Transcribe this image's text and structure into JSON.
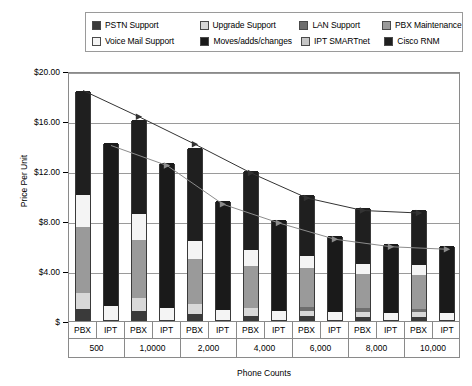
{
  "chart_data": {
    "type": "bar",
    "title": "",
    "xlabel": "Phone Counts",
    "ylabel": "Price Per Unit",
    "ylim": [
      0,
      20
    ],
    "yticks": [
      "$",
      "$4.00",
      "$8.00",
      "$12.00",
      "$16.00",
      "$20.00"
    ],
    "ytick_values": [
      0,
      4,
      8,
      12,
      16,
      20
    ],
    "grid": true,
    "stacked": true,
    "legend_position": "top",
    "groups": [
      "500",
      "1,0000",
      "2,000",
      "4,000",
      "6,000",
      "8,000",
      "10,000"
    ],
    "subcategories": [
      "PBX",
      "IPT"
    ],
    "categories": [
      "PBX",
      "IPT",
      "PBX",
      "IPT",
      "PBX",
      "IPT",
      "PBX",
      "IPT",
      "PBX",
      "IPT",
      "PBX",
      "IPT",
      "PBX",
      "IPT"
    ],
    "series": [
      {
        "name": "PSTN Support",
        "color": "#3a3a3a",
        "values": [
          0.85,
          0.0,
          0.7,
          0.0,
          0.45,
          0.0,
          0.35,
          0.0,
          0.3,
          0.0,
          0.28,
          0.0,
          0.26,
          0.0
        ]
      },
      {
        "name": "Upgrade Support",
        "color": "#d8d8d8",
        "values": [
          1.3,
          0.0,
          1.1,
          0.0,
          0.85,
          0.0,
          0.6,
          0.0,
          0.45,
          0.0,
          0.4,
          0.0,
          0.38,
          0.0
        ]
      },
      {
        "name": "LAN Support",
        "color": "#6e6e6e",
        "values": [
          0.0,
          0.0,
          0.0,
          0.0,
          0.0,
          0.0,
          0.0,
          0.0,
          0.3,
          0.0,
          0.28,
          0.0,
          0.26,
          0.0
        ]
      },
      {
        "name": "PBX Maintenance",
        "color": "#9a9a9a",
        "values": [
          5.3,
          0.0,
          4.6,
          0.0,
          3.55,
          0.0,
          3.35,
          0.0,
          3.1,
          0.0,
          2.7,
          0.0,
          2.7,
          0.0
        ]
      },
      {
        "name": "Voice Mail Support",
        "color": "#f4f4f4",
        "values": [
          2.55,
          1.1,
          2.1,
          0.95,
          1.45,
          0.8,
          1.3,
          0.7,
          1.0,
          0.65,
          0.84,
          0.6,
          0.8,
          0.6
        ]
      },
      {
        "name": "Moves/adds/changes",
        "color": "#1a1a1a",
        "values": [
          0.0,
          13.1,
          0.0,
          11.65,
          0.0,
          8.7,
          0.0,
          7.3,
          0.0,
          6.05,
          0.0,
          5.5,
          0.0,
          5.3
        ]
      },
      {
        "name": "IPT SMARTnet",
        "color": "#c6c6c6",
        "values": [
          0.0,
          0.0,
          0.0,
          0.0,
          0.0,
          0.0,
          0.0,
          0.0,
          0.0,
          0.0,
          0.0,
          0.0,
          0.0,
          0.0
        ]
      },
      {
        "name": "Cisco RNM",
        "color": "#1f1f1f",
        "values": [
          8.3,
          0.0,
          7.5,
          0.0,
          7.5,
          0.0,
          6.35,
          0.0,
          4.85,
          0.0,
          4.5,
          0.0,
          4.4,
          0.0
        ]
      }
    ],
    "totals": {
      "pbx": [
        18.6,
        16.5,
        14.3,
        12.0,
        10.0,
        9.0,
        8.8
      ],
      "ipt": [
        14.2,
        12.6,
        9.5,
        8.0,
        6.7,
        6.1,
        5.9
      ]
    },
    "trendlines": [
      {
        "name": "PBX total trend",
        "values": [
          18.6,
          16.5,
          14.3,
          12.0,
          10.0,
          9.0,
          8.8
        ],
        "color": "#333333"
      },
      {
        "name": "IPT total trend",
        "values": [
          14.2,
          12.6,
          9.5,
          8.0,
          6.7,
          6.1,
          5.9
        ],
        "color": "#8c8c8c"
      }
    ]
  },
  "legend": {
    "rows": [
      [
        {
          "label": "PSTN Support",
          "color": "#3a3a3a",
          "width": 112
        },
        {
          "label": "Upgrade Support",
          "color": "#d8d8d8",
          "width": 104
        },
        {
          "label": "LAN Support",
          "color": "#6e6e6e",
          "width": 86
        },
        {
          "label": "PBX Maintenance",
          "color": "#9a9a9a",
          "width": 74
        }
      ],
      [
        {
          "label": "Voice Mail Support",
          "color": "#f4f4f4",
          "width": 112
        },
        {
          "label": "Moves/adds/changes",
          "color": "#1a1a1a",
          "width": 104
        },
        {
          "label": "IPT SMARTnet",
          "color": "#c6c6c6",
          "width": 86
        },
        {
          "label": "Cisco RNM",
          "color": "#1f1f1f",
          "width": 74
        }
      ]
    ]
  }
}
